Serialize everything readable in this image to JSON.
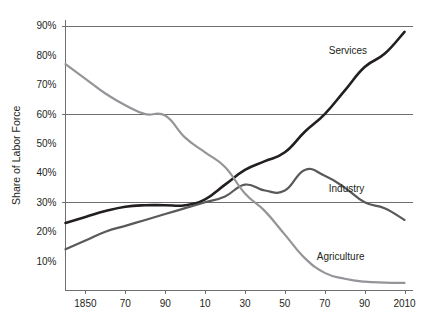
{
  "chart_data": {
    "type": "line",
    "title": "",
    "xlabel": "",
    "ylabel": "Share of Labor Force",
    "ylim": [
      0,
      92
    ],
    "xlim": [
      1840,
      2014
    ],
    "grid": true,
    "gridlines_y": [
      90,
      60,
      30
    ],
    "legend_position": "inline-right",
    "y_ticks": [
      10,
      20,
      30,
      40,
      50,
      60,
      70,
      80,
      90
    ],
    "y_tick_labels": [
      "10%",
      "20%",
      "30%",
      "40%",
      "50%",
      "60%",
      "70%",
      "80%",
      "90%"
    ],
    "x_ticks": [
      1850,
      1870,
      1890,
      1910,
      1930,
      1950,
      1970,
      1990,
      2010
    ],
    "x_tick_labels": [
      "1850",
      "70",
      "90",
      "10",
      "30",
      "50",
      "70",
      "90",
      "2010"
    ],
    "series": [
      {
        "name": "Services",
        "label": "Services",
        "color": "#231f20",
        "width": 2.6,
        "label_x": 1972,
        "label_y": 80.5,
        "x": [
          1840,
          1850,
          1860,
          1870,
          1880,
          1890,
          1900,
          1910,
          1920,
          1930,
          1940,
          1950,
          1960,
          1970,
          1980,
          1990,
          2000,
          2010
        ],
        "values": [
          23,
          25,
          27,
          28.5,
          29,
          29,
          29,
          31,
          36,
          41,
          44,
          47,
          54,
          60,
          68,
          76,
          80.5,
          88
        ]
      },
      {
        "name": "Industry",
        "label": "Industry",
        "color": "#58595b",
        "width": 2.2,
        "label_x": 1972,
        "label_y": 33.5,
        "x": [
          1840,
          1850,
          1860,
          1870,
          1880,
          1890,
          1900,
          1910,
          1920,
          1930,
          1940,
          1950,
          1960,
          1970,
          1980,
          1990,
          2000,
          2010
        ],
        "values": [
          14,
          17,
          20,
          22,
          24,
          26,
          28,
          30,
          32,
          36,
          34,
          34,
          41,
          39,
          35,
          30,
          28,
          24
        ]
      },
      {
        "name": "Agriculture",
        "label": "Agriculture",
        "color": "#939598",
        "width": 2.2,
        "label_x": 1966,
        "label_y": 10.5,
        "x": [
          1840,
          1850,
          1860,
          1870,
          1880,
          1890,
          1900,
          1910,
          1920,
          1930,
          1940,
          1950,
          1960,
          1970,
          1980,
          1990,
          2000,
          2010
        ],
        "values": [
          77,
          72,
          67,
          63,
          60,
          59.5,
          52,
          47,
          42,
          33,
          27,
          19,
          11,
          6,
          4,
          3,
          2.7,
          2.6
        ]
      }
    ]
  },
  "axes": {
    "y_axis_title": "Share of Labor Force"
  }
}
